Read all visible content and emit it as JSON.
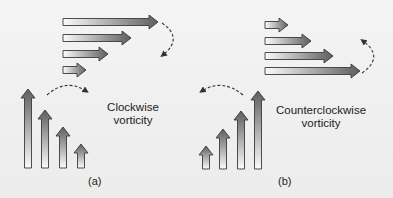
{
  "panels": [
    {
      "id": "a",
      "caption": "(a)",
      "title_line1": "Clockwise",
      "title_line2": "vorticity",
      "horizontal_arrows": [
        {
          "x0": 63,
          "y": 22,
          "tip": 158
        },
        {
          "x0": 63,
          "y": 38,
          "tip": 131
        },
        {
          "x0": 63,
          "y": 54,
          "tip": 108
        },
        {
          "x0": 63,
          "y": 70,
          "tip": 86
        }
      ],
      "vertical_arrows": [
        {
          "x": 28,
          "top": 89,
          "bottom": 168
        },
        {
          "x": 45,
          "top": 110,
          "bottom": 168
        },
        {
          "x": 63,
          "top": 127,
          "bottom": 168
        },
        {
          "x": 81,
          "top": 144,
          "bottom": 168
        }
      ],
      "rotation": "clockwise"
    },
    {
      "id": "b",
      "caption": "(b)",
      "title_line1": "Counterclockwise",
      "title_line2": "vorticity",
      "horizontal_arrows": [
        {
          "x0": 265,
          "y": 25,
          "tip": 288
        },
        {
          "x0": 265,
          "y": 41,
          "tip": 311
        },
        {
          "x0": 265,
          "y": 56,
          "tip": 333
        },
        {
          "x0": 265,
          "y": 71,
          "tip": 360
        }
      ],
      "vertical_arrows": [
        {
          "x": 206,
          "top": 146,
          "bottom": 169
        },
        {
          "x": 223,
          "top": 129,
          "bottom": 169
        },
        {
          "x": 241,
          "top": 111,
          "bottom": 169
        },
        {
          "x": 258,
          "top": 91,
          "bottom": 169
        }
      ],
      "rotation": "counterclockwise"
    }
  ],
  "colors": {
    "arrow_head": "#5e5e5e",
    "arrow_tail": "#fafafa",
    "outline": "#3a3a3a",
    "dash": "#333333"
  }
}
